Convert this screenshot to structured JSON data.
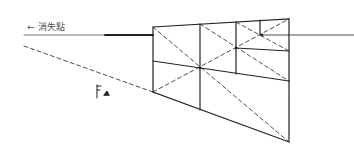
{
  "diagram": {
    "label": {
      "arrow": "←",
      "text": "消失點"
    },
    "figure_mark": "ſ ▵",
    "colors": {
      "stroke": "#222222",
      "text": "#555555",
      "background": "#ffffff"
    },
    "horizon_y": 35,
    "quad": {
      "top_left": [
        153,
        27
      ],
      "top_right": [
        289,
        19
      ],
      "bottom_right": [
        289,
        142
      ],
      "bottom_left": [
        153,
        92
      ]
    }
  }
}
